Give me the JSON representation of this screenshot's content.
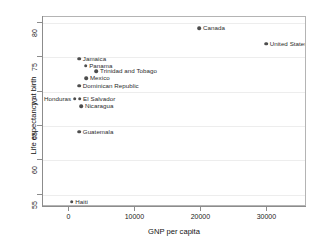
{
  "chart_data": {
    "type": "scatter",
    "title": "",
    "xlabel": "GNP per capita",
    "ylabel": "Life expectancy at birth",
    "xlim": [
      -4000,
      36000
    ],
    "ylim": [
      53.2,
      80.9
    ],
    "xticks": [
      0,
      10000,
      20000,
      30000
    ],
    "xticklabels": [
      "0",
      "10000",
      "20000",
      "30000"
    ],
    "yticks": [
      55,
      60,
      65,
      70,
      75,
      80
    ],
    "yticklabels": [
      "55",
      "60",
      "65",
      "70",
      "75",
      "80"
    ],
    "grid": "horizontal",
    "legend": "none",
    "marker_color": "#4d4d4d",
    "points": [
      {
        "label": "Canada",
        "x": 19700,
        "y": 79.3,
        "label_side": "right"
      },
      {
        "label": "United States",
        "x": 29800,
        "y": 77.0,
        "label_side": "right"
      },
      {
        "label": "Jamaica",
        "x": 1480,
        "y": 74.8,
        "label_side": "right"
      },
      {
        "label": "Panama",
        "x": 2450,
        "y": 73.8,
        "label_side": "right"
      },
      {
        "label": "Trinidad and Tobago",
        "x": 4100,
        "y": 73.0,
        "label_side": "right"
      },
      {
        "label": "Mexico",
        "x": 2560,
        "y": 72.0,
        "label_side": "right"
      },
      {
        "label": "Dominican Republic",
        "x": 1490,
        "y": 70.9,
        "label_side": "right"
      },
      {
        "label": "Honduras",
        "x": 800,
        "y": 69.0,
        "label_side": "left"
      },
      {
        "label": "El Salvador",
        "x": 1530,
        "y": 69.0,
        "label_side": "right"
      },
      {
        "label": "Nicaragua",
        "x": 1800,
        "y": 67.9,
        "label_side": "right"
      },
      {
        "label": "Guatemala",
        "x": 1480,
        "y": 64.2,
        "label_side": "right"
      },
      {
        "label": "Haiti",
        "x": 340,
        "y": 54.0,
        "label_side": "right"
      }
    ]
  }
}
